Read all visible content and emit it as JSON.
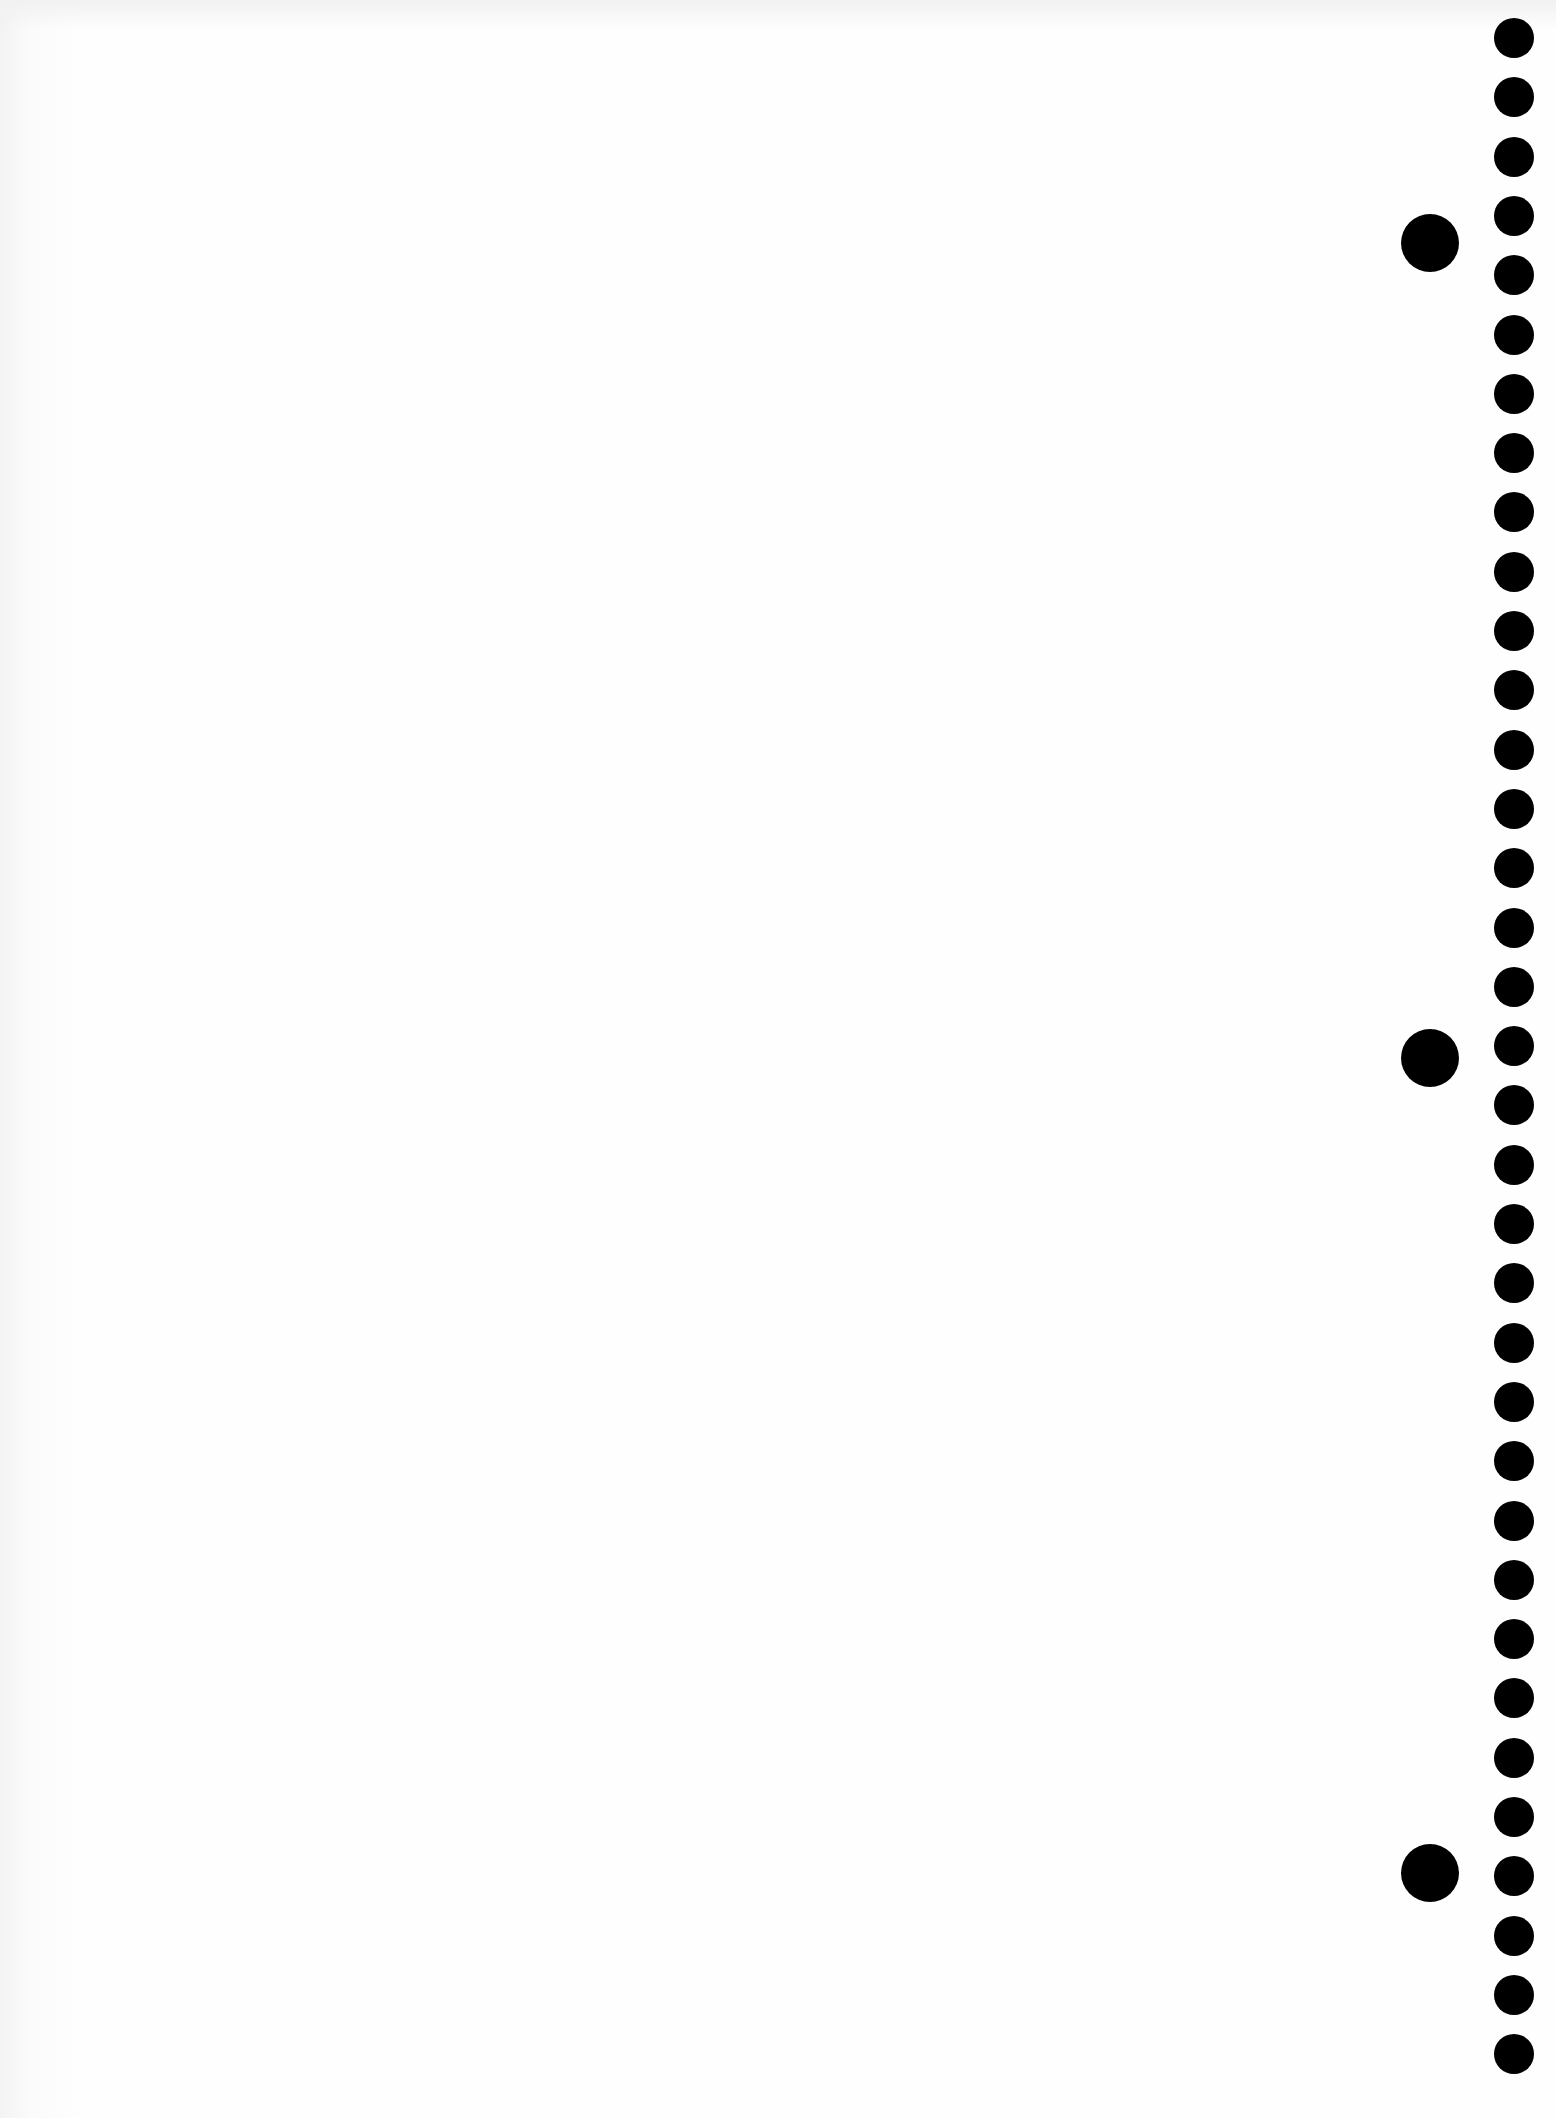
{
  "page": {
    "type": "blank notebook page",
    "background_color": "#fdfdfd",
    "content_text": ""
  },
  "binding_holes": {
    "color": "#000000",
    "small": {
      "count": 35,
      "center_x": 1514,
      "first_center_y": 38,
      "spacing_y": 59.3,
      "diameter": 40
    },
    "large": {
      "count": 3,
      "center_x": 1430,
      "centers_y": [
        243,
        1058,
        1873
      ],
      "diameter": 58
    }
  }
}
